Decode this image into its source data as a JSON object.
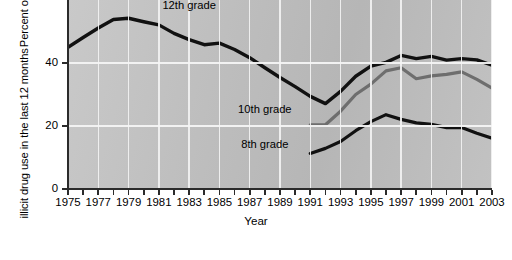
{
  "chart_data": {
    "type": "line",
    "title": "",
    "xlabel": "Year",
    "ylabel": "Percent of students who reported illicit drug use in the last 12 months",
    "ylabel_line1": "Percent of students who reported",
    "ylabel_line2": "illicit drug use in the last 12 months",
    "xlim": [
      1975,
      2003
    ],
    "ylim": [
      0,
      60
    ],
    "yticks": [
      0,
      20,
      40
    ],
    "ytick_labels": [
      "0",
      "20",
      "40"
    ],
    "xticks": [
      1975,
      1976,
      1977,
      1978,
      1979,
      1980,
      1981,
      1982,
      1983,
      1984,
      1985,
      1986,
      1987,
      1988,
      1989,
      1990,
      1991,
      1992,
      1993,
      1994,
      1995,
      1996,
      1997,
      1998,
      1999,
      2000,
      2001,
      2002,
      2003
    ],
    "xtick_labels_shown": [
      "1975",
      "1977",
      "1979",
      "1981",
      "1983",
      "1985",
      "1987",
      "1989",
      "1991",
      "1993",
      "1995",
      "1997",
      "1999",
      "2001",
      "2003"
    ],
    "grid": "white gridlines at every odd year and at y=20,40",
    "legend_position": "inline-labels",
    "note": "top of plot is cropped by the image frame; 12th grade peak near 54 is partially clipped",
    "series": [
      {
        "name": "12th grade",
        "color": "#111111",
        "width": 3.4,
        "label_x": 1983,
        "label_y": 58,
        "x": [
          1975,
          1976,
          1977,
          1978,
          1979,
          1980,
          1981,
          1982,
          1983,
          1984,
          1985,
          1986,
          1987,
          1988,
          1989,
          1990,
          1991,
          1992,
          1993,
          1994,
          1995,
          1996,
          1997,
          1998,
          1999,
          2000,
          2001,
          2002,
          2003
        ],
        "values": [
          45.0,
          48.1,
          51.1,
          53.8,
          54.2,
          53.1,
          52.1,
          49.4,
          47.4,
          45.8,
          46.3,
          44.3,
          41.7,
          38.5,
          35.4,
          32.5,
          29.4,
          27.1,
          31.0,
          35.8,
          39.0,
          40.2,
          42.4,
          41.4,
          42.1,
          40.9,
          41.4,
          41.0,
          39.3
        ]
      },
      {
        "name": "10th grade",
        "color": "#6e6e6e",
        "width": 3.2,
        "label_x": 1988,
        "label_y": 25,
        "x": [
          1991,
          1992,
          1993,
          1994,
          1995,
          1996,
          1997,
          1998,
          1999,
          2000,
          2001,
          2002,
          2003
        ],
        "values": [
          20.4,
          20.4,
          24.7,
          30.0,
          33.3,
          37.5,
          38.5,
          35.0,
          35.9,
          36.4,
          37.2,
          34.8,
          32.0
        ]
      },
      {
        "name": "8th grade",
        "color": "#111111",
        "width": 3.2,
        "label_x": 1988,
        "label_y": 14,
        "x": [
          1991,
          1992,
          1993,
          1994,
          1995,
          1996,
          1997,
          1998,
          1999,
          2000,
          2001,
          2002,
          2003
        ],
        "values": [
          11.3,
          12.9,
          15.1,
          18.5,
          21.4,
          23.6,
          22.1,
          21.0,
          20.5,
          19.5,
          19.5,
          17.7,
          16.1
        ]
      }
    ]
  },
  "axes": {
    "x_title": "Year"
  }
}
